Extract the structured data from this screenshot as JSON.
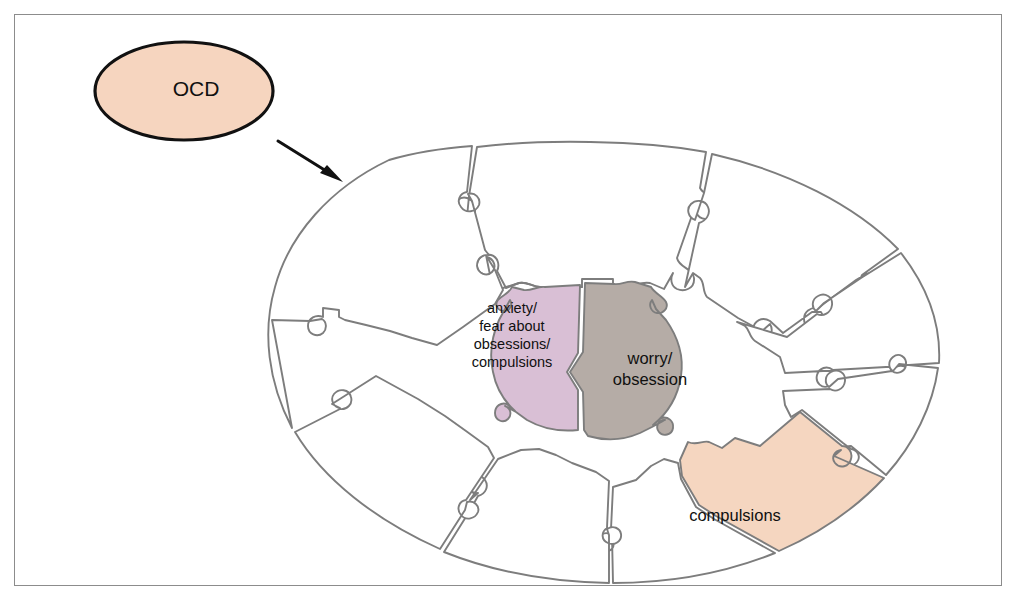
{
  "figure": {
    "kind": "jigsaw-wheel-diagram",
    "frame": {
      "visible": true,
      "border_color": "#8c8c8c"
    },
    "background_color": "#ffffff"
  },
  "callout": {
    "label": "OCD",
    "shape": "ellipse",
    "fill_color": "#f6d5bf",
    "border_color": "#111111",
    "arrow": {
      "name": "arrow-to-wheel",
      "from": [
        278,
        141
      ],
      "to": [
        341,
        181
      ],
      "color": "#111111"
    }
  },
  "wheel": {
    "outer_shape": "ellipse",
    "outer_fill": "#ffffff",
    "outline_color": "#7d7d7d",
    "outer_piece_count": 8,
    "core_piece_count": 2,
    "colors": {
      "anxiety": "#d9bfd5",
      "worry": "#b5aca6",
      "compulsions": "#f5d6c0",
      "empty": "#ffffff"
    },
    "core_pieces": [
      {
        "name": "core-piece-anxiety",
        "fill": "#d9bfd5",
        "lines": [
          "anxiety/",
          "fear about",
          "obsessions/",
          "compulsions"
        ]
      },
      {
        "name": "core-piece-worry",
        "fill": "#b5aca6",
        "lines": [
          "worry/",
          "obsession"
        ]
      }
    ],
    "outer_pieces": [
      {
        "name": "outer-piece-1",
        "fill": "#ffffff",
        "label": ""
      },
      {
        "name": "outer-piece-2",
        "fill": "#ffffff",
        "label": ""
      },
      {
        "name": "outer-piece-3",
        "fill": "#ffffff",
        "label": ""
      },
      {
        "name": "outer-piece-4",
        "fill": "#ffffff",
        "label": ""
      },
      {
        "name": "outer-piece-5",
        "fill": "#ffffff",
        "label": ""
      },
      {
        "name": "outer-piece-6",
        "fill": "#f5d6c0",
        "label": "compulsions"
      },
      {
        "name": "outer-piece-7",
        "fill": "#ffffff",
        "label": ""
      },
      {
        "name": "outer-piece-8",
        "fill": "#ffffff",
        "label": ""
      }
    ],
    "labels": {
      "compulsions": "compulsions",
      "anxiety_l1": "anxiety/",
      "anxiety_l2": "fear about",
      "anxiety_l3": "obsessions/",
      "anxiety_l4": "compulsions",
      "worry_l1": "worry/",
      "worry_l2": "obsession"
    }
  }
}
